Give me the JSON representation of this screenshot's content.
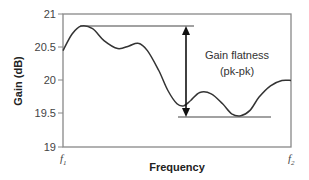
{
  "chart_data": {
    "type": "line",
    "title": "",
    "xlabel": "Frequency",
    "ylabel": "Gain (dB)",
    "ylim": [
      19,
      21
    ],
    "yticks": [
      "21",
      "20.5",
      "20",
      "19.5",
      "19"
    ],
    "xticks": [
      {
        "base": "f",
        "sub": "1"
      },
      {
        "base": "f",
        "sub": "2"
      }
    ],
    "grid": false,
    "legend": null,
    "series": [
      {
        "name": "Gain",
        "x_normalized": [
          0.0,
          0.04,
          0.08,
          0.13,
          0.18,
          0.24,
          0.29,
          0.33,
          0.37,
          0.42,
          0.46,
          0.5,
          0.53,
          0.56,
          0.6,
          0.65,
          0.7,
          0.74,
          0.78,
          0.82,
          0.86,
          0.91,
          0.96,
          1.0
        ],
        "values": [
          20.45,
          20.7,
          20.82,
          20.78,
          20.6,
          20.48,
          20.52,
          20.56,
          20.45,
          20.15,
          19.85,
          19.65,
          19.62,
          19.7,
          19.82,
          19.8,
          19.65,
          19.5,
          19.47,
          19.55,
          19.75,
          19.92,
          20.0,
          20.0
        ]
      }
    ],
    "annotations": {
      "max_line_value": 20.82,
      "min_line_value": 19.47,
      "label_line1": "Gain flatness",
      "label_line2": "(pk-pk)",
      "type": "double-arrow"
    }
  }
}
